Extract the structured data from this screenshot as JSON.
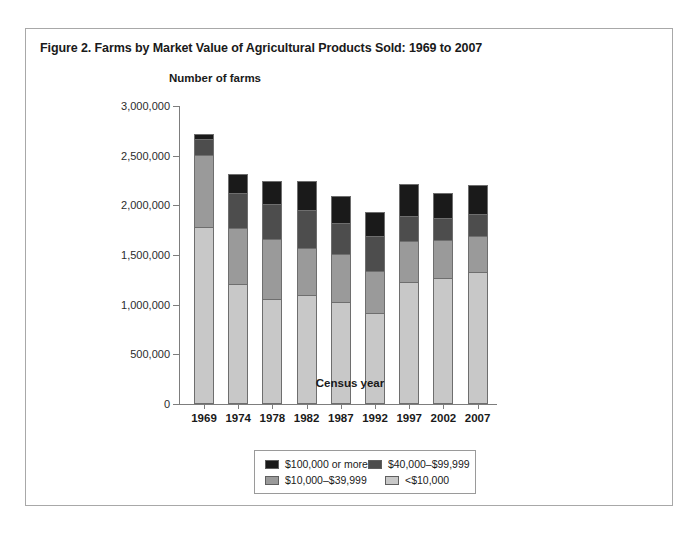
{
  "figure": {
    "title": "Figure 2. Farms by Market Value of Agricultural Products Sold: 1969 to 2007"
  },
  "chart_data": {
    "type": "bar",
    "stacked": true,
    "title": "Figure 2. Farms by Market Value of Agricultural Products Sold: 1969 to 2007",
    "xlabel": "Census year",
    "ylabel": "Number of farms",
    "ylim": [
      0,
      3000000
    ],
    "ytick_labels": [
      "3,000,000",
      "2,500,000",
      "2,000,000",
      "1,500,000",
      "1,000,000",
      "500,000",
      "0"
    ],
    "ytick_values": [
      3000000,
      2500000,
      2000000,
      1500000,
      1000000,
      500000,
      0
    ],
    "grid": false,
    "legend_position": "bottom",
    "categories": [
      "1969",
      "1974",
      "1978",
      "1982",
      "1987",
      "1992",
      "1997",
      "2002",
      "2007"
    ],
    "series": [
      {
        "name": "<$10,000",
        "color": "#c8c8c8",
        "values": [
          1780000,
          1205000,
          1060000,
          1100000,
          1030000,
          920000,
          1230000,
          1270000,
          1325000
        ]
      },
      {
        "name": "$10,000-$39,999",
        "color": "#9a9a9a",
        "values": [
          730000,
          570000,
          605000,
          475000,
          480000,
          420000,
          415000,
          385000,
          370000
        ]
      },
      {
        "name": "$40,000-$99,999",
        "color": "#4d4d4d",
        "values": [
          155000,
          345000,
          350000,
          380000,
          310000,
          350000,
          245000,
          215000,
          215000
        ]
      },
      {
        "name": "$100,000 or more",
        "color": "#1a1a1a",
        "values": [
          55000,
          195000,
          235000,
          290000,
          275000,
          240000,
          326000,
          259000,
          295000
        ]
      }
    ],
    "totals": [
      2720000,
      2315000,
      2250000,
      2245000,
      2095000,
      1930000,
      2216000,
      2129000,
      2205000
    ]
  },
  "legend": {
    "entries": [
      {
        "label": "$100,000 or more",
        "color": "#1a1a1a"
      },
      {
        "label": "$40,000–$99,999",
        "color": "#4d4d4d"
      },
      {
        "label": "$10,000–$39,999",
        "color": "#9a9a9a"
      },
      {
        "label": "<$10,000",
        "color": "#c8c8c8"
      }
    ]
  }
}
